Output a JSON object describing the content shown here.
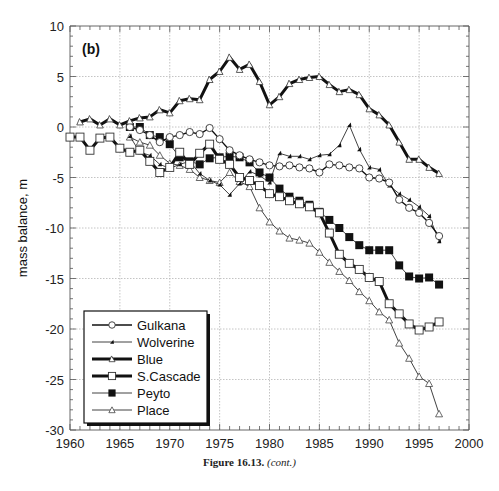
{
  "figure": {
    "panel_label": "(b)",
    "caption_label": "Figure 16.13.",
    "caption_note": "(cont.)"
  },
  "chart_data": {
    "type": "line",
    "title": "",
    "panel_label": "(b)",
    "xlabel": "",
    "ylabel": "mass balance, m",
    "xlim": [
      1960,
      2000
    ],
    "ylim": [
      -30,
      10
    ],
    "x_ticks": [
      1960,
      1965,
      1970,
      1975,
      1980,
      1985,
      1990,
      1995,
      2000
    ],
    "y_ticks": [
      10,
      5,
      0,
      -5,
      -10,
      -15,
      -20,
      -25,
      -30
    ],
    "grid": true,
    "legend_position": "lower-left",
    "series": [
      {
        "name": "Gulkana",
        "marker": "open-circle",
        "line": "medium",
        "x": [
          1966,
          1967,
          1968,
          1969,
          1970,
          1971,
          1972,
          1973,
          1974,
          1975,
          1976,
          1977,
          1978,
          1979,
          1980,
          1981,
          1982,
          1983,
          1984,
          1985,
          1986,
          1987,
          1988,
          1989,
          1990,
          1991,
          1992,
          1993,
          1994,
          1995,
          1996,
          1997
        ],
        "values": [
          0,
          -0.3,
          -0.8,
          -1.5,
          -1.0,
          -0.8,
          -0.5,
          -0.7,
          -0.1,
          -1.2,
          -2.3,
          -2.8,
          -3.2,
          -3.5,
          -3.8,
          -3.9,
          -3.8,
          -4.0,
          -4.1,
          -4.5,
          -3.7,
          -3.8,
          -4.0,
          -4.1,
          -5.0,
          -5.1,
          -5.5,
          -7.2,
          -8.0,
          -8.5,
          -9.5,
          -10.8
        ]
      },
      {
        "name": "Wolverine",
        "marker": "filled-triangle",
        "line": "thin",
        "x": [
          1966,
          1967,
          1968,
          1969,
          1970,
          1971,
          1972,
          1973,
          1974,
          1975,
          1976,
          1977,
          1978,
          1979,
          1980,
          1981,
          1982,
          1983,
          1984,
          1985,
          1986,
          1987,
          1988,
          1989,
          1990,
          1991,
          1992,
          1993,
          1994,
          1995,
          1996,
          1997
        ],
        "values": [
          -0.9,
          -2.5,
          -2.8,
          -3.7,
          -4.1,
          -3.7,
          -3.4,
          -4.6,
          -5.3,
          -5.7,
          -6.7,
          -5.6,
          -4.4,
          -4.8,
          -5.5,
          -2.6,
          -2.9,
          -2.9,
          -3.2,
          -2.8,
          -2.7,
          -1.8,
          0.2,
          -2.2,
          -4.0,
          -4.2,
          -5.8,
          -6.6,
          -7.2,
          -7.9,
          -8.8,
          -11.3
        ]
      },
      {
        "name": "Blue",
        "marker": "open-triangle-filled-line",
        "line": "thick",
        "x": [
          1961,
          1962,
          1963,
          1964,
          1965,
          1966,
          1967,
          1968,
          1969,
          1970,
          1971,
          1972,
          1973,
          1974,
          1975,
          1976,
          1977,
          1978,
          1979,
          1980,
          1981,
          1982,
          1983,
          1984,
          1985,
          1986,
          1987,
          1988,
          1989,
          1990,
          1991,
          1992,
          1993,
          1994,
          1995,
          1996,
          1997
        ],
        "values": [
          0.5,
          0.8,
          0.2,
          0.8,
          0.2,
          0.6,
          0.9,
          1.0,
          1.7,
          1.4,
          2.6,
          2.8,
          2.7,
          4.7,
          5.5,
          6.9,
          5.7,
          6.2,
          4.5,
          2.2,
          3.0,
          4.3,
          4.7,
          4.9,
          5.0,
          4.2,
          3.5,
          3.7,
          3.2,
          1.8,
          1.2,
          0.2,
          -1.5,
          -3.2,
          -3.2,
          -4.0,
          -4.6
        ]
      },
      {
        "name": "S.Cascade",
        "marker": "open-square",
        "line": "thick",
        "x": [
          1960,
          1961,
          1962,
          1963,
          1964,
          1965,
          1966,
          1967,
          1968,
          1969,
          1970,
          1971,
          1972,
          1973,
          1974,
          1975,
          1976,
          1977,
          1978,
          1979,
          1980,
          1981,
          1982,
          1983,
          1984,
          1985,
          1986,
          1987,
          1988,
          1989,
          1990,
          1991,
          1992,
          1993,
          1994,
          1995,
          1996,
          1997
        ],
        "values": [
          -1.0,
          -1.0,
          -2.3,
          -1.1,
          -1.0,
          -2.1,
          -2.5,
          -2.3,
          -3.4,
          -4.5,
          -4.0,
          -2.5,
          -3.7,
          -2.6,
          -1.7,
          -3.2,
          -3.7,
          -5.0,
          -5.3,
          -5.8,
          -6.6,
          -6.9,
          -7.3,
          -7.6,
          -7.9,
          -8.5,
          -10.5,
          -12.6,
          -13.5,
          -14.1,
          -14.9,
          -15.3,
          -17.5,
          -18.5,
          -19.5,
          -20.1,
          -19.8,
          -19.3
        ]
      },
      {
        "name": "Peyto",
        "marker": "filled-square",
        "line": "thin",
        "x": [
          1966,
          1967,
          1968,
          1969,
          1970,
          1971,
          1972,
          1973,
          1974,
          1975,
          1976,
          1977,
          1978,
          1979,
          1980,
          1981,
          1982,
          1983,
          1984,
          1985,
          1986,
          1987,
          1988,
          1989,
          1990,
          1991,
          1992,
          1993,
          1994,
          1995,
          1996,
          1997
        ],
        "values": [
          0,
          0,
          -0.8,
          -1.0,
          -1.7,
          -3.0,
          -3.4,
          -3.7,
          -3.1,
          -3.0,
          -2.9,
          -3.0,
          -3.5,
          -4.5,
          -5.0,
          -6.1,
          -6.9,
          -7.3,
          -7.7,
          -8.4,
          -9.2,
          -10.0,
          -10.9,
          -11.7,
          -12.2,
          -12.2,
          -12.2,
          -13.7,
          -14.8,
          -15.0,
          -14.9,
          -15.6
        ]
      },
      {
        "name": "Place",
        "marker": "open-triangle",
        "line": "thin",
        "x": [
          1966,
          1967,
          1968,
          1969,
          1970,
          1971,
          1972,
          1973,
          1974,
          1975,
          1976,
          1977,
          1978,
          1979,
          1980,
          1981,
          1982,
          1983,
          1984,
          1985,
          1986,
          1987,
          1988,
          1989,
          1990,
          1991,
          1992,
          1993,
          1994,
          1995,
          1996,
          1997
        ],
        "values": [
          -1.0,
          -1.5,
          -1.8,
          -2.8,
          -3.6,
          -3.8,
          -4.2,
          -5.0,
          -5.3,
          -5.5,
          -4.5,
          -5.4,
          -5.9,
          -8.0,
          -9.4,
          -10.3,
          -11.0,
          -11.2,
          -11.5,
          -12.4,
          -13.4,
          -14.3,
          -15.2,
          -16.3,
          -17.2,
          -18.3,
          -19.1,
          -21.4,
          -22.9,
          -24.7,
          -25.4,
          -28.4
        ]
      }
    ]
  }
}
